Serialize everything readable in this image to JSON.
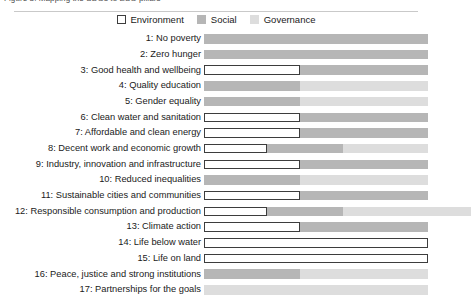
{
  "top_caption": "Figure 3. Mapping the SDGs to ESG pillars",
  "legend": {
    "position": "top-center",
    "items": [
      {
        "label": "Environment",
        "key": "env",
        "color": "#ffffff",
        "border": "#3d3d3d"
      },
      {
        "label": "Social",
        "key": "soc",
        "color": "#b6b6b6",
        "border": "#b6b6b6"
      },
      {
        "label": "Governance",
        "key": "gov",
        "color": "#dddddd",
        "border": "#dddddd"
      }
    ]
  },
  "chart_data": {
    "type": "bar",
    "orientation": "horizontal",
    "stacked": true,
    "normalized": true,
    "title": "",
    "xlabel": "",
    "ylabel": "",
    "xlim": [
      0,
      100
    ],
    "grid": false,
    "legend_position": "top-center",
    "categories": [
      "1: No poverty",
      "2: Zero hunger",
      "3: Good health and wellbeing",
      "4: Quality education",
      "5: Gender equality",
      "6: Clean water and sanitation",
      "7: Affordable and clean energy",
      "8: Decent work and economic growth",
      "9: Industry, innovation and infrastructure",
      "10: Reduced inequalities",
      "11: Sustainable cities and communities",
      "12: Responsible consumption and production",
      "13: Climate action",
      "14: Life below water",
      "15: Life on land",
      "16: Peace, justice and strong institutions",
      "17: Partnerships for the goals"
    ],
    "series": [
      {
        "name": "Environment",
        "values": [
          0,
          0,
          43,
          0,
          0,
          43,
          43,
          28,
          43,
          0,
          43,
          28,
          43,
          100,
          100,
          0,
          0
        ]
      },
      {
        "name": "Social",
        "values": [
          100,
          100,
          57,
          43,
          43,
          57,
          57,
          34,
          57,
          43,
          57,
          34,
          57,
          0,
          0,
          43,
          0
        ]
      },
      {
        "name": "Governance",
        "values": [
          0,
          0,
          0,
          57,
          57,
          0,
          0,
          38,
          0,
          57,
          0,
          57,
          0,
          0,
          0,
          57,
          100
        ]
      }
    ]
  }
}
